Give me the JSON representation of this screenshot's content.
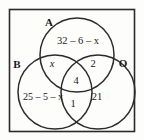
{
  "figure": {
    "type": "venn-diagram-3-set",
    "title": "",
    "universe_box": true,
    "stroke_color": "#2b2b2b",
    "fill_color": "none",
    "background_color": "#fdfdfb"
  },
  "sets": [
    {
      "id": "A",
      "label": "A",
      "position": "top"
    },
    {
      "id": "B",
      "label": "B",
      "position": "bottom-left"
    },
    {
      "id": "O",
      "label": "O",
      "position": "bottom-right"
    }
  ],
  "regions": [
    {
      "id": "A-only",
      "label": "32 – 6 – x",
      "sets": "A only"
    },
    {
      "id": "A-and-B",
      "label": "x",
      "sets": "A ∩ B only"
    },
    {
      "id": "A-and-O",
      "label": "2",
      "sets": "A ∩ O only"
    },
    {
      "id": "A-and-B-and-O",
      "label": "4",
      "sets": "A ∩ B ∩ O"
    },
    {
      "id": "B-only",
      "label": "25 – 5 – x",
      "sets": "B only"
    },
    {
      "id": "B-and-O",
      "label": "1",
      "sets": "B ∩ O only"
    },
    {
      "id": "O-only",
      "label": "21",
      "sets": "O only"
    }
  ],
  "labels": {
    "set_a": "A",
    "set_b": "B",
    "set_o": "O",
    "a_only": "32 – 6 – x",
    "a_b": "x",
    "a_o": "2",
    "a_b_o": "4",
    "b_only": "25 – 5 – x",
    "b_o": "1",
    "o_only": "21"
  }
}
